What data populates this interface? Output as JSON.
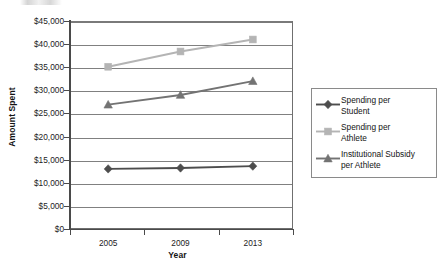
{
  "chart_data": {
    "type": "line",
    "title": "",
    "xlabel": "Year",
    "ylabel": "Amount Spent",
    "categories": [
      "2005",
      "2009",
      "2013"
    ],
    "ylim": [
      0,
      45000
    ],
    "ytick_values": [
      0,
      5000,
      10000,
      15000,
      20000,
      25000,
      30000,
      35000,
      40000,
      45000
    ],
    "ytick_labels": [
      "$0",
      "$5,000",
      "$10,000",
      "$15,000",
      "$20,000",
      "$25,000",
      "$30,000",
      "$35,000",
      "$40,000",
      "$45,000"
    ],
    "grid": "horizontal",
    "legend_position": "right",
    "series": [
      {
        "name": "Spending per Student",
        "label_lines": "Spending per\nStudent",
        "marker": "diamond",
        "color": "#4d4d4d",
        "values": [
          13000,
          13200,
          13600
        ]
      },
      {
        "name": "Spending per Athlete",
        "label_lines": "Spending per\nAthlete",
        "marker": "square",
        "color": "#b4b4b4",
        "values": [
          35100,
          38400,
          41000
        ]
      },
      {
        "name": "Institutional Subsidy per Athlete",
        "label_lines": "Institutional Subsidy\nper Athlete",
        "marker": "triangle",
        "color": "#737373",
        "values": [
          26900,
          29000,
          32000
        ]
      }
    ]
  },
  "colors": {
    "axis": "#4a4a4a",
    "gridline": "#808080",
    "plot_border": "#6f6f6f",
    "legend_border": "#8a8a8a",
    "text": "#1a1a1a",
    "background": "#ffffff"
  }
}
